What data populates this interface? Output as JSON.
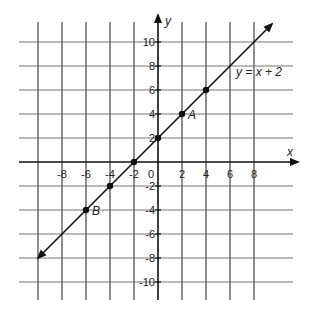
{
  "chart_data": {
    "type": "line",
    "title": "",
    "equation_label": "y = x + 2",
    "xlabel": "x",
    "ylabel": "y",
    "xlim": [
      -10,
      10
    ],
    "ylim": [
      -10,
      10
    ],
    "grid": true,
    "grid_step": 2,
    "x_tick_labels": [
      "-8",
      "-6",
      "-4",
      "-2",
      "2",
      "4",
      "6",
      "8"
    ],
    "y_tick_labels": [
      "10",
      "8",
      "6",
      "4",
      "2",
      "-2",
      "-4",
      "-6",
      "-8",
      "-10"
    ],
    "origin_label": "0",
    "line": {
      "slope": 1,
      "intercept": 2,
      "from": [
        -10,
        -8
      ],
      "to": [
        9.5,
        11.5
      ]
    },
    "points": [
      {
        "x": -6,
        "y": -4,
        "label": "B"
      },
      {
        "x": -4,
        "y": -2,
        "label": ""
      },
      {
        "x": -2,
        "y": 0,
        "label": ""
      },
      {
        "x": 0,
        "y": 2,
        "label": ""
      },
      {
        "x": 2,
        "y": 4,
        "label": "A"
      },
      {
        "x": 4,
        "y": 6,
        "label": ""
      }
    ]
  }
}
